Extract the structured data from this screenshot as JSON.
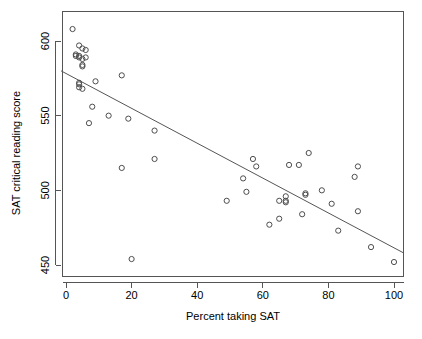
{
  "chart_data": {
    "type": "scatter",
    "title": "",
    "xlabel": "Percent taking SAT",
    "ylabel": "SAT critical reading score",
    "xlim": [
      -1.5,
      103
    ],
    "ylim": [
      446,
      611
    ],
    "xticks": [
      0,
      20,
      40,
      60,
      80,
      100
    ],
    "yticks": [
      450,
      500,
      550,
      600
    ],
    "grid": false,
    "legend": null,
    "marker": "open-circle",
    "points": [
      {
        "x": 2,
        "y": 608
      },
      {
        "x": 4,
        "y": 597
      },
      {
        "x": 5,
        "y": 595
      },
      {
        "x": 6,
        "y": 594
      },
      {
        "x": 3,
        "y": 591
      },
      {
        "x": 3,
        "y": 590
      },
      {
        "x": 4,
        "y": 590
      },
      {
        "x": 4,
        "y": 589
      },
      {
        "x": 5,
        "y": 588
      },
      {
        "x": 6,
        "y": 589
      },
      {
        "x": 5,
        "y": 584
      },
      {
        "x": 5,
        "y": 583
      },
      {
        "x": 9,
        "y": 573
      },
      {
        "x": 17,
        "y": 577
      },
      {
        "x": 4,
        "y": 572
      },
      {
        "x": 4,
        "y": 571
      },
      {
        "x": 4,
        "y": 569
      },
      {
        "x": 5,
        "y": 568
      },
      {
        "x": 8,
        "y": 556
      },
      {
        "x": 13,
        "y": 550
      },
      {
        "x": 19,
        "y": 548
      },
      {
        "x": 7,
        "y": 545
      },
      {
        "x": 27,
        "y": 540
      },
      {
        "x": 27,
        "y": 521
      },
      {
        "x": 17,
        "y": 515
      },
      {
        "x": 20,
        "y": 454
      },
      {
        "x": 49,
        "y": 493
      },
      {
        "x": 54,
        "y": 508
      },
      {
        "x": 55,
        "y": 499
      },
      {
        "x": 57,
        "y": 521
      },
      {
        "x": 58,
        "y": 516
      },
      {
        "x": 62,
        "y": 477
      },
      {
        "x": 65,
        "y": 481
      },
      {
        "x": 65,
        "y": 493
      },
      {
        "x": 67,
        "y": 496
      },
      {
        "x": 67,
        "y": 492
      },
      {
        "x": 67,
        "y": 493
      },
      {
        "x": 68,
        "y": 517
      },
      {
        "x": 71,
        "y": 517
      },
      {
        "x": 72,
        "y": 484
      },
      {
        "x": 73,
        "y": 498
      },
      {
        "x": 73,
        "y": 497
      },
      {
        "x": 74,
        "y": 525
      },
      {
        "x": 78,
        "y": 500
      },
      {
        "x": 81,
        "y": 491
      },
      {
        "x": 83,
        "y": 473
      },
      {
        "x": 88,
        "y": 509
      },
      {
        "x": 89,
        "y": 516
      },
      {
        "x": 89,
        "y": 486
      },
      {
        "x": 93,
        "y": 462
      },
      {
        "x": 100,
        "y": 452
      }
    ],
    "fit_line": {
      "label": "least-squares regression line",
      "x_start": -1.5,
      "y_start": 580,
      "x_end": 103,
      "y_end": 458
    }
  }
}
